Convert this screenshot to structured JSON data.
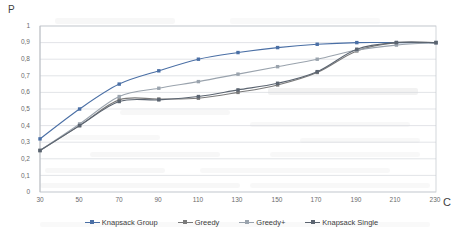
{
  "chart_data": {
    "type": "line",
    "title": "",
    "xlabel": "C",
    "ylabel": "P",
    "xlim": [
      30,
      230
    ],
    "ylim": [
      0,
      1
    ],
    "grid": true,
    "grid_axis": "y",
    "legend_position": "bottom",
    "x": [
      30,
      50,
      70,
      90,
      110,
      130,
      150,
      170,
      190,
      210,
      230
    ],
    "xticks": [
      "30",
      "50",
      "70",
      "90",
      "110",
      "130",
      "150",
      "170",
      "190",
      "210",
      "230"
    ],
    "yticks": [
      "0",
      "0,1",
      "0,2",
      "0,3",
      "0,4",
      "0,5",
      "0,6",
      "0,7",
      "0,8",
      "0,9",
      "1"
    ],
    "series": [
      {
        "name": "Knapsack Group",
        "color": "#4a6fa5",
        "marker": "square",
        "values": [
          0.32,
          0.5,
          0.65,
          0.73,
          0.8,
          0.84,
          0.87,
          0.89,
          0.9,
          0.9,
          0.9
        ]
      },
      {
        "name": "Greedy",
        "color": "#7a7a7a",
        "marker": "square",
        "values": [
          0.25,
          0.4,
          0.555,
          0.56,
          0.565,
          0.6,
          0.645,
          0.72,
          0.85,
          0.9,
          0.9
        ]
      },
      {
        "name": "Greedy+",
        "color": "#9aa3ad",
        "marker": "square",
        "values": [
          0.25,
          0.41,
          0.575,
          0.625,
          0.665,
          0.71,
          0.755,
          0.8,
          0.855,
          0.885,
          0.9
        ]
      },
      {
        "name": "Knapsack Single",
        "color": "#5b6470",
        "marker": "square",
        "values": [
          0.25,
          0.4,
          0.545,
          0.555,
          0.575,
          0.615,
          0.655,
          0.725,
          0.86,
          0.9,
          0.9
        ]
      }
    ]
  },
  "legend": {
    "items": [
      {
        "label": "Knapsack Group"
      },
      {
        "label": "Greedy"
      },
      {
        "label": "Greedy+"
      },
      {
        "label": "Knapsack Single"
      }
    ]
  },
  "axes": {
    "y_axis_title": "P",
    "x_axis_title": "C"
  }
}
